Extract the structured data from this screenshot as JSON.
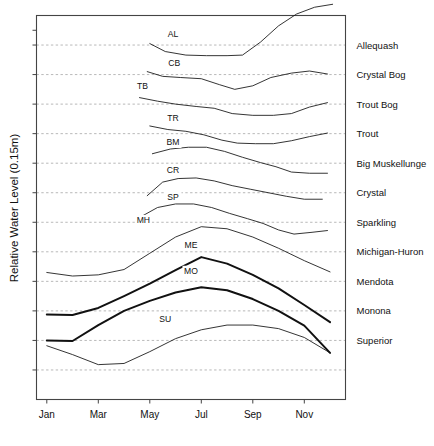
{
  "chart_data": {
    "type": "line",
    "title": "",
    "xlabel": "",
    "ylabel": "Relative Water Level (0.15m)",
    "x": [
      1,
      2,
      3,
      4,
      5,
      6,
      7,
      8,
      9,
      10,
      11,
      12
    ],
    "x_tick_positions": [
      1,
      3,
      5,
      7,
      9,
      11
    ],
    "x_tick_labels": [
      "Jan",
      "Mar",
      "May",
      "Jul",
      "Sep",
      "Nov"
    ],
    "xlim": [
      0.6,
      12.6
    ],
    "ylim": [
      0,
      13
    ],
    "grid": true,
    "grid_axis": "y",
    "grid_style": "dotted",
    "y_gridline_values": [
      12,
      11,
      10,
      9,
      8,
      7,
      6,
      5,
      4,
      3,
      2,
      1
    ],
    "y_tick_values": [
      12.5,
      12,
      11,
      10,
      9,
      8,
      7,
      6,
      5,
      4,
      3,
      2,
      1
    ],
    "legend": "inline-right",
    "note": "Each series is offset vertically; right-hand text labels sit at each series baseline gridline. Inline two-letter codes mark each curve.",
    "series": [
      {
        "name": "Allequash",
        "code": "AL",
        "label_y": 12,
        "bold": false,
        "code_pos": {
          "x": 5.9,
          "y": 12.28
        },
        "x": [
          5,
          5.6,
          6.4,
          7.2,
          8,
          8.6,
          9.3,
          10,
          10.7,
          11.4,
          12.1
        ],
        "values": [
          12.05,
          11.78,
          11.66,
          11.64,
          11.64,
          11.66,
          12.1,
          12.65,
          13.05,
          13.28,
          13.38
        ]
      },
      {
        "name": "Crystal Bog",
        "code": "CB",
        "label_y": 11,
        "bold": false,
        "code_pos": {
          "x": 5.95,
          "y": 11.3
        },
        "x": [
          4.9,
          5.5,
          6.2,
          7,
          7.7,
          8.3,
          9,
          9.7,
          10.5,
          11.2,
          11.9
        ],
        "values": [
          11.1,
          10.94,
          10.9,
          10.86,
          10.66,
          10.5,
          10.62,
          10.9,
          11.05,
          11.12,
          11.02
        ]
      },
      {
        "name": "Trout Bog",
        "code": "TB",
        "label_y": 10,
        "bold": false,
        "code_pos": {
          "x": 4.72,
          "y": 10.52
        },
        "x": [
          4.6,
          5.3,
          6,
          6.8,
          7.5,
          8.2,
          9,
          9.8,
          10.5,
          11.2,
          11.9
        ],
        "values": [
          10.22,
          10.1,
          10.0,
          9.92,
          9.86,
          9.68,
          9.62,
          9.62,
          9.68,
          9.9,
          10.05
        ]
      },
      {
        "name": "Trout",
        "code": "TR",
        "label_y": 9,
        "bold": false,
        "code_pos": {
          "x": 5.9,
          "y": 9.44
        },
        "x": [
          5,
          5.7,
          6.4,
          7.1,
          7.8,
          8.4,
          9.1,
          9.8,
          10.5,
          11.2,
          11.9
        ],
        "values": [
          9.26,
          9.14,
          9.08,
          8.96,
          8.78,
          8.68,
          8.66,
          8.66,
          8.76,
          8.9,
          9.02
        ]
      },
      {
        "name": "Big Muskellunge",
        "code": "BM",
        "label_y": 8,
        "bold": false,
        "code_pos": {
          "x": 5.9,
          "y": 8.6
        },
        "x": [
          5.1,
          5.8,
          6.5,
          7.2,
          7.9,
          8.6,
          9.3,
          9.9,
          10.5,
          11.2,
          11.9
        ],
        "values": [
          8.32,
          8.48,
          8.54,
          8.54,
          8.4,
          8.2,
          8.02,
          7.88,
          7.7,
          7.66,
          7.66
        ]
      },
      {
        "name": "Crystal",
        "code": "CR",
        "label_y": 7,
        "bold": false,
        "code_pos": {
          "x": 5.9,
          "y": 7.66
        },
        "x": [
          4.9,
          5.5,
          6.1,
          6.8,
          7.5,
          8.2,
          8.9,
          9.6,
          10.3,
          11,
          11.7
        ],
        "values": [
          6.9,
          7.36,
          7.48,
          7.5,
          7.4,
          7.24,
          7.12,
          7.0,
          6.88,
          6.78,
          6.78
        ]
      },
      {
        "name": "Sparkling",
        "code": "SP",
        "label_y": 6,
        "bold": false,
        "code_pos": {
          "x": 5.9,
          "y": 6.74
        },
        "x": [
          4.6,
          5.3,
          6,
          6.7,
          7.4,
          8.1,
          8.8,
          9.4,
          10,
          10.6,
          11.3,
          11.9
        ],
        "values": [
          6.16,
          6.5,
          6.62,
          6.62,
          6.5,
          6.3,
          6.12,
          5.96,
          5.74,
          5.6,
          5.66,
          5.72
        ]
      },
      {
        "name": "Michigan-Huron",
        "code": "MH",
        "label_y": 5,
        "bold": false,
        "code_pos": {
          "x": 4.75,
          "y": 5.96
        },
        "x": [
          1,
          2,
          3,
          4,
          5,
          6,
          7,
          8,
          9,
          10,
          11,
          12
        ],
        "values": [
          4.3,
          4.18,
          4.22,
          4.4,
          4.95,
          5.5,
          5.85,
          5.78,
          5.5,
          5.12,
          4.7,
          4.32
        ]
      },
      {
        "name": "Mendota",
        "code": "ME",
        "label_y": 4,
        "bold": true,
        "code_pos": {
          "x": 6.6,
          "y": 5.12
        },
        "x": [
          1,
          2,
          3,
          4,
          5,
          6,
          7,
          8,
          9,
          10,
          11,
          12
        ],
        "values": [
          2.88,
          2.86,
          3.1,
          3.5,
          3.92,
          4.38,
          4.82,
          4.6,
          4.22,
          3.76,
          3.2,
          2.62
        ]
      },
      {
        "name": "Monona",
        "code": "MO",
        "label_y": 3,
        "bold": true,
        "code_pos": {
          "x": 6.6,
          "y": 4.24
        },
        "x": [
          1,
          2,
          3,
          4,
          5,
          6,
          7,
          8,
          9,
          10,
          11,
          12
        ],
        "values": [
          2.0,
          1.98,
          2.52,
          3.0,
          3.34,
          3.62,
          3.8,
          3.7,
          3.4,
          3.0,
          2.5,
          1.58
        ]
      },
      {
        "name": "Superior",
        "code": "SU",
        "label_y": 2,
        "bold": false,
        "code_pos": {
          "x": 5.6,
          "y": 2.62
        },
        "x": [
          1,
          2,
          3,
          4,
          5,
          6,
          7,
          8,
          9,
          10,
          11,
          12
        ],
        "values": [
          1.82,
          1.52,
          1.18,
          1.22,
          1.62,
          2.06,
          2.36,
          2.52,
          2.52,
          2.4,
          2.1,
          1.58
        ]
      }
    ]
  }
}
